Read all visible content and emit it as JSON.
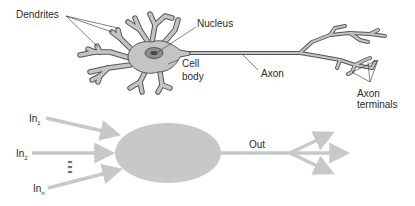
{
  "neuron": {
    "labels": {
      "dendrites": "Dendrites",
      "nucleus": "Nucleus",
      "cell_body_line1": "Cell",
      "cell_body_line2": "body",
      "axon": "Axon",
      "axon_terminals_line1": "Axon",
      "axon_terminals_line2": "terminals"
    },
    "colors": {
      "fill": "#c4c4c4",
      "stroke": "#555555",
      "nucleus_fill": "#8e8e8e",
      "nucleolus_fill": "#444444"
    }
  },
  "model": {
    "inputs": [
      {
        "base": "In",
        "sub": "1"
      },
      {
        "base": "In",
        "sub": "2"
      },
      {
        "base": "In",
        "sub": "n"
      }
    ],
    "ellipsis": "•••",
    "output_label": "Out",
    "colors": {
      "node_fill": "#c8c8c8",
      "arrow": "#c8c8c8"
    }
  }
}
